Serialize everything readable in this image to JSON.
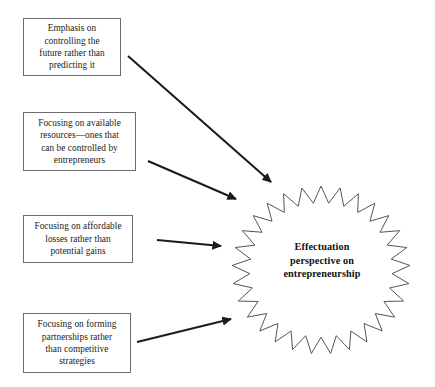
{
  "diagram": {
    "type": "radial-influence-diagram",
    "colors": {
      "box_border": "#6b6b70",
      "box_fill": "#ffffff",
      "arrow": "#1c1c1c",
      "star_stroke": "#555555",
      "star_fill": "#ffffff",
      "text": "#1a1a1a",
      "background": "#ffffff"
    },
    "center": {
      "label": "Effectuation perspective on entrepreneurship",
      "lines": [
        "Effectuation",
        "perspective on",
        "entrepreneurship"
      ],
      "shape": "starburst",
      "spikes": 29,
      "cx": 321,
      "cy": 270,
      "outer_rx": 89,
      "outer_ry": 84,
      "inner_ratio": 0.8
    },
    "boxes": [
      {
        "id": "box-0",
        "label": "Emphasis on controlling the future rather than predicting it",
        "lines": [
          "Emphasis on",
          "controlling the",
          "future rather than",
          "predicting it"
        ]
      },
      {
        "id": "box-1",
        "label": "Focusing on available resources—ones that can be controlled by entrepreneurs",
        "lines": [
          "Focusing on available",
          "resources—ones that",
          "can be controlled by",
          "entrepreneurs"
        ]
      },
      {
        "id": "box-2",
        "label": "Focusing on affordable losses rather than potential gains",
        "lines": [
          "Focusing on affordable",
          "losses rather than",
          "potential gains"
        ]
      },
      {
        "id": "box-3",
        "label": "Focusing on forming partnerships rather than competitive strategies",
        "lines": [
          "Focusing on forming",
          "partnerships rather",
          "than competitive",
          "strategies"
        ]
      }
    ],
    "arrows": [
      {
        "id": "arrow-0",
        "from_box": "box-0",
        "x1": 128,
        "y1": 56,
        "x2": 271,
        "y2": 182
      },
      {
        "id": "arrow-1",
        "from_box": "box-1",
        "x1": 148,
        "y1": 161,
        "x2": 236,
        "y2": 199
      },
      {
        "id": "arrow-2",
        "from_box": "box-2",
        "x1": 157,
        "y1": 240,
        "x2": 221,
        "y2": 246
      },
      {
        "id": "arrow-3",
        "from_box": "box-3",
        "x1": 137,
        "y1": 342,
        "x2": 231,
        "y2": 319
      }
    ]
  }
}
